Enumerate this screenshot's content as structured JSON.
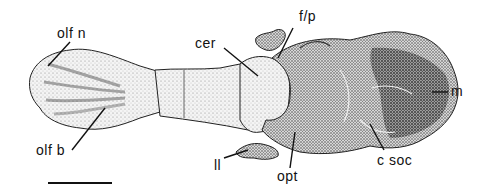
{
  "figure": {
    "type": "anatomical stipple drawing, dorsal view of endocast",
    "labels": [
      {
        "id": "olf_n",
        "text": "olf n"
      },
      {
        "id": "olf_b",
        "text": "olf b"
      },
      {
        "id": "cer",
        "text": "cer"
      },
      {
        "id": "f_p",
        "text": "f/p"
      },
      {
        "id": "ll",
        "text": "ll"
      },
      {
        "id": "opt",
        "text": "opt"
      },
      {
        "id": "c_soc",
        "text": "c soc"
      },
      {
        "id": "m",
        "text": "m"
      }
    ],
    "scale_bar": {
      "visible": true
    }
  }
}
